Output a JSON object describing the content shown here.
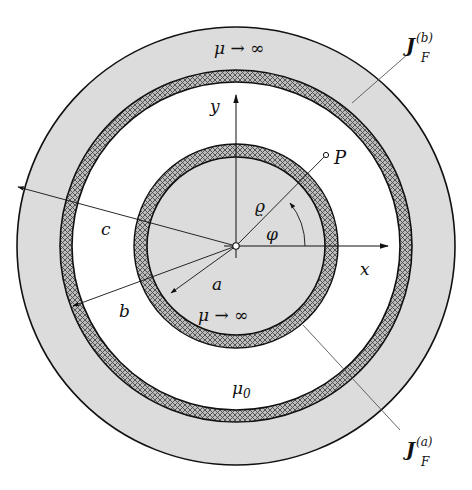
{
  "figure": {
    "colors": {
      "magnetic_material_fill": "#dcdcdc",
      "hatch_dark": "#555555",
      "hatch_fill": "#b9b9b9",
      "stroke": "#111111",
      "background": "#ffffff"
    },
    "regions": {
      "outer_shell": "μ → ∞",
      "inner_core": "μ → ∞",
      "gap": "μ₀"
    },
    "labels": {
      "outer_mu": "μ → ∞",
      "inner_mu": "μ → ∞",
      "gap_mu_base": "μ",
      "gap_mu_sub": "0",
      "y_axis": "y",
      "x_axis": "x",
      "point": "P",
      "rho": "ϱ",
      "phi": "φ",
      "radius_a": "a",
      "radius_b": "b",
      "radius_c": "c",
      "current_b_base": "J",
      "current_b_sub": "F",
      "current_b_sup": "(b)",
      "current_a_base": "J",
      "current_a_sub": "F",
      "current_a_sup": "(a)"
    }
  }
}
